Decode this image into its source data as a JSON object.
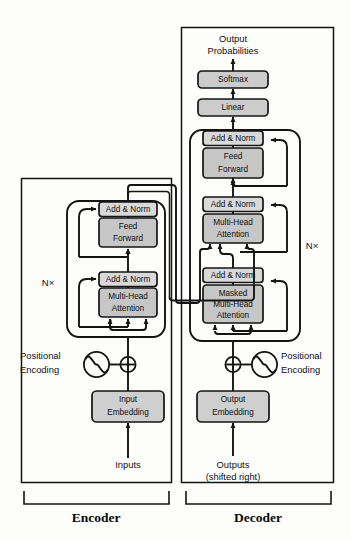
{
  "figure": {
    "colors": {
      "addnorm_fill": "#d9d9d9",
      "sublayer_fill": "#c6c6c6",
      "embedding_fill": "#cfcfcf",
      "softmax_fill": "#cccccc",
      "stack_fill": "#e4e4e4",
      "line": "#141414",
      "background": "#fdfdfc"
    }
  },
  "encoder": {
    "footer_label": "Encoder",
    "repeat_label": "N×",
    "input_label": "Inputs",
    "positional_label_line1": "Positional",
    "positional_label_line2": "Encoding",
    "embedding_label_line1": "Input",
    "embedding_label_line2": "Embedding",
    "blocks": [
      {
        "name": "add-norm-2",
        "label": "Add & Norm",
        "lines": [
          "Add & Norm"
        ]
      },
      {
        "name": "feed-forward",
        "label": "Feed Forward",
        "lines": [
          "Feed",
          "Forward"
        ]
      },
      {
        "name": "add-norm-1",
        "label": "Add & Norm",
        "lines": [
          "Add & Norm"
        ]
      },
      {
        "name": "multi-head-attention",
        "label": "Multi-Head Attention",
        "lines": [
          "Multi-Head",
          "Attention"
        ]
      }
    ]
  },
  "decoder": {
    "footer_label": "Decoder",
    "repeat_label": "N×",
    "output_label_line1": "Outputs",
    "output_label_line2": "(shifted right)",
    "positional_label_line1": "Positional",
    "positional_label_line2": "Encoding",
    "embedding_label_line1": "Output",
    "embedding_label_line2": "Embedding",
    "top_label_line1": "Output",
    "top_label_line2": "Probabilities",
    "softmax_label": "Softmax",
    "linear_label": "Linear",
    "blocks": [
      {
        "name": "add-norm-3",
        "label": "Add & Norm",
        "lines": [
          "Add & Norm"
        ]
      },
      {
        "name": "feed-forward",
        "label": "Feed Forward",
        "lines": [
          "Feed",
          "Forward"
        ]
      },
      {
        "name": "add-norm-2",
        "label": "Add & Norm",
        "lines": [
          "Add & Norm"
        ]
      },
      {
        "name": "multi-head-attention",
        "label": "Multi-Head Attention",
        "lines": [
          "Multi-Head",
          "Attention"
        ]
      },
      {
        "name": "add-norm-1",
        "label": "Add & Norm",
        "lines": [
          "Add & Norm"
        ]
      },
      {
        "name": "masked-multi-head-attention",
        "label": "Masked Multi-Head Attention",
        "lines": [
          "Masked",
          "Multi-Head",
          "Attention"
        ]
      }
    ]
  }
}
